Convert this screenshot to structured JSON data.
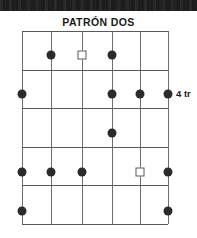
{
  "banner": {
    "name": "top-dark-banner"
  },
  "title": "PATRÓN DOS",
  "labels": {
    "fret_marker": "4 tr"
  },
  "colors": {
    "banner": "#1c1c1c",
    "title_text": "#1a1a1a",
    "grid_line": "#6e6e6e",
    "fret_line": "#5a5a5a",
    "dot_fill": "#2b2b2b",
    "square_stroke": "#5a5a5a",
    "background": "#ffffff"
  },
  "chart_data": {
    "type": "scatter",
    "title": "PATRÓN DOS",
    "xlabel": "",
    "ylabel": "",
    "grid": true,
    "legend": "none",
    "strings": 6,
    "frets": 5,
    "string_x": [
      22,
      51,
      82,
      112,
      140,
      168
    ],
    "fret_y": [
      31,
      70,
      108,
      147,
      185,
      224
    ],
    "row_centers_y": [
      55,
      94,
      133,
      172,
      211
    ],
    "xlim": [
      1,
      6
    ],
    "ylim": [
      1,
      5
    ],
    "markers": [
      {
        "string": 2,
        "fret": 1,
        "shape": "dot",
        "x": 51,
        "y": 55
      },
      {
        "string": 3,
        "fret": 1,
        "shape": "square",
        "x": 82,
        "y": 55
      },
      {
        "string": 4,
        "fret": 1,
        "shape": "dot",
        "x": 112,
        "y": 55
      },
      {
        "string": 1,
        "fret": 2,
        "shape": "dot",
        "x": 22,
        "y": 94
      },
      {
        "string": 4,
        "fret": 2,
        "shape": "dot",
        "x": 112,
        "y": 94
      },
      {
        "string": 5,
        "fret": 2,
        "shape": "dot",
        "x": 140,
        "y": 94
      },
      {
        "string": 6,
        "fret": 2,
        "shape": "dot",
        "x": 168,
        "y": 94
      },
      {
        "string": 4,
        "fret": 3,
        "shape": "dot",
        "x": 112,
        "y": 133
      },
      {
        "string": 1,
        "fret": 4,
        "shape": "dot",
        "x": 22,
        "y": 172
      },
      {
        "string": 2,
        "fret": 4,
        "shape": "dot",
        "x": 51,
        "y": 172
      },
      {
        "string": 3,
        "fret": 4,
        "shape": "dot",
        "x": 82,
        "y": 172
      },
      {
        "string": 5,
        "fret": 4,
        "shape": "square",
        "x": 140,
        "y": 172
      },
      {
        "string": 6,
        "fret": 4,
        "shape": "dot",
        "x": 168,
        "y": 172
      },
      {
        "string": 1,
        "fret": 5,
        "shape": "dot",
        "x": 22,
        "y": 211
      },
      {
        "string": 6,
        "fret": 5,
        "shape": "dot",
        "x": 168,
        "y": 211
      }
    ],
    "annotations": [
      {
        "text": "4 tr",
        "x": 176,
        "y": 94,
        "anchor": "left"
      }
    ]
  }
}
